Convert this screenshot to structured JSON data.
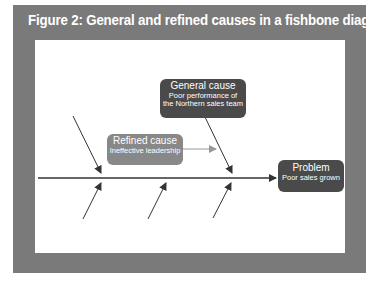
{
  "figure": {
    "title": "Figure 2: General and refined causes in a fishbone diagram"
  },
  "nodes": {
    "general_cause": {
      "heading": "General cause",
      "line1": "Poor performance of",
      "line2": "the Northern sales team"
    },
    "refined_cause": {
      "heading": "Refined cause",
      "line1": "Ineffective leadership"
    },
    "problem": {
      "heading": "Problem",
      "line1": "Poor sales grown"
    }
  },
  "colors": {
    "frame": "#7a7a7a",
    "panel": "#ffffff",
    "dark_box": "#4a4a4a",
    "refined_box": "#888888",
    "line": "#333333"
  }
}
